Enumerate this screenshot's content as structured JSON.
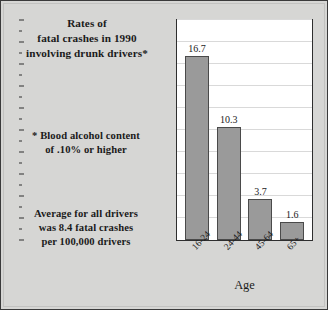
{
  "figure": {
    "background_color": "#d6d6d4",
    "border_color": "#3a3a3a"
  },
  "annotations": {
    "title_lines": [
      "Rates of",
      "fatal crashes in 1990",
      "involving drunk drivers*"
    ],
    "footnote_lines": [
      "* Blood alcohol content",
      "of .10% or higher"
    ],
    "average_lines": [
      "Average for all drivers",
      "was 8.4 fatal crashes",
      "per 100,000 drivers"
    ]
  },
  "chart_data": {
    "type": "bar",
    "title": "Rates of fatal crashes in 1990 involving drunk drivers*",
    "categories": [
      "16-24",
      "24-44",
      "45-64",
      "65+"
    ],
    "values": [
      16.7,
      10.3,
      3.7,
      1.6
    ],
    "value_labels": [
      "16.7",
      "10.3",
      "3.7",
      "1.6"
    ],
    "xlabel": "Age",
    "ylabel": "Per 100,000",
    "ylim": [
      0,
      20
    ],
    "yticks": [
      0,
      2,
      4,
      6,
      8,
      10,
      12,
      14,
      16,
      18,
      20
    ],
    "ytick_labels": [
      "0",
      "2",
      "4",
      "6",
      "8",
      "10",
      "12",
      "14",
      "16",
      "18",
      "20"
    ],
    "grid": true,
    "legend": false,
    "bar_color": "#9a9a9a",
    "bar_edge_color": "#4a4a4a",
    "plot_background": "#ffffff",
    "gridline_color": "#d9d9d9"
  }
}
